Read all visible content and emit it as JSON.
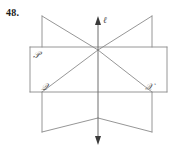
{
  "problem": {
    "number": "48."
  },
  "figure": {
    "title": "Three intersecting planes with common line",
    "line_label": "ℓ",
    "plane_labels": {
      "p": "𝒫",
      "q": "𝒬",
      "r": "𝒳"
    },
    "colors": {
      "edge": "#8a8a8a",
      "line": "#6e6e6e",
      "arrow": "#3a3a3a",
      "label": "#5a5a5a",
      "number": "#1a1a1a",
      "background": "#ffffff"
    },
    "geometry": {
      "center": [
        98,
        50
      ],
      "line_top": [
        98,
        18
      ],
      "line_bottom": [
        98,
        142
      ],
      "plane_p_rect": [
        30,
        47,
        167,
        92
      ],
      "plane_q_points": "42,16 98,50 98,118 42,132",
      "plane_r_points": "152,16 98,50 98,118 152,132"
    }
  }
}
